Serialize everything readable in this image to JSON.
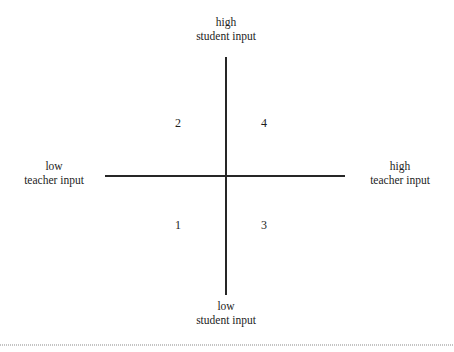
{
  "figure": {
    "background_color": "#ffffff",
    "axis_color": "#262626",
    "text_color": "#1d1d1d"
  },
  "chart_data": {
    "type": "scatter",
    "title": "",
    "subtitle": "",
    "xlabel": "teacher input",
    "ylabel": "student input",
    "grid": false,
    "legend": "none",
    "x_axis": {
      "low_label_line1": "low",
      "low_label_line2": "teacher input",
      "high_label_line1": "high",
      "high_label_line2": "teacher input"
    },
    "y_axis": {
      "low_label_line1": "low",
      "low_label_line2": "student input",
      "high_label_line1": "high",
      "high_label_line2": "student input"
    },
    "quadrants": [
      {
        "id": "1",
        "label": "1",
        "position": "lower-left",
        "teacher_input": "low",
        "student_input": "low"
      },
      {
        "id": "2",
        "label": "2",
        "position": "upper-left",
        "teacher_input": "low",
        "student_input": "high"
      },
      {
        "id": "3",
        "label": "3",
        "position": "lower-right",
        "teacher_input": "high",
        "student_input": "low"
      },
      {
        "id": "4",
        "label": "4",
        "position": "upper-right",
        "teacher_input": "high",
        "student_input": "high"
      }
    ],
    "categories": [
      "1",
      "2",
      "3",
      "4"
    ],
    "values": [
      1,
      2,
      3,
      4
    ]
  },
  "labels": {
    "top": {
      "line1": "high",
      "line2": "student input"
    },
    "bottom": {
      "line1": "low",
      "line2": "student input"
    },
    "left": {
      "line1": "low",
      "line2": "teacher input"
    },
    "right": {
      "line1": "high",
      "line2": "teacher input"
    }
  },
  "quadrant_numbers": {
    "upper_left": "2",
    "upper_right": "4",
    "lower_left": "1",
    "lower_right": "3"
  }
}
